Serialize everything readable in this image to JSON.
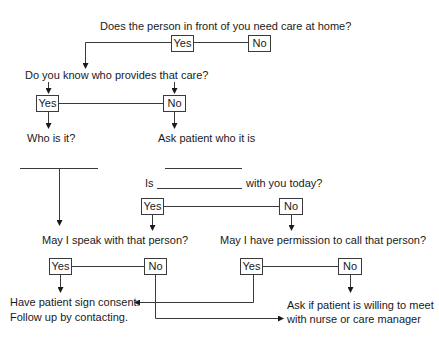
{
  "diagram": {
    "type": "flowchart",
    "colors": {
      "line": "#3a3a3a",
      "text": "#1a1a1a",
      "background": "#ffffff"
    },
    "questions": {
      "q1": "Does the person in front of you need care at home?",
      "q2": "Do you know who provides that care?",
      "q3_prefix": "Is",
      "q3_suffix": "with you today?",
      "q4": "May I speak with that person?",
      "q5": "May I have permission to call that person?"
    },
    "statements": {
      "who_is_it": "Who is it?",
      "ask_patient": "Ask patient who it is",
      "consent_line1": "Have patient sign consent.",
      "consent_line2": "Follow up by contacting.",
      "meet_line1": "Ask if patient is willing to meet",
      "meet_line2": "with nurse or care manager"
    },
    "answers": {
      "q1_yes": "Yes",
      "q1_no": "No",
      "q2_yes": "Yes",
      "q2_no": "No",
      "q3_yes": "Yes",
      "q3_no": "No",
      "q4_yes": "Yes",
      "q4_no": "No",
      "q5_yes": "Yes",
      "q5_no": "No"
    }
  }
}
